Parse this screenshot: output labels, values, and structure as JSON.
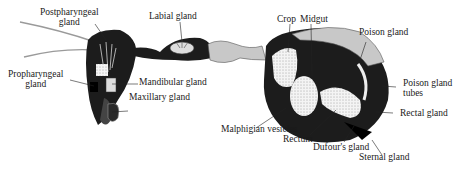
{
  "diagram": {
    "colors": {
      "body_dark": "#1c1c1c",
      "body_light": "#c8c8c8",
      "stipple": "#f2f2f2",
      "line": "#333333"
    },
    "labels": {
      "postpharyngeal_1": "Postpharyngeal",
      "postpharyngeal_2": "gland",
      "labial": "Labial gland",
      "propharyngeal_1": "Propharyngeal",
      "propharyngeal_2": "gland",
      "mandibular": "Mandibular gland",
      "maxillary": "Maxillary gland",
      "crop": "Crop",
      "midgut": "Midgut",
      "poison": "Poison gland",
      "poison_tubes_1": "Poison gland",
      "poison_tubes_2": "tubes",
      "rectal": "Rectal gland",
      "malphigian": "Malphigian vesicles",
      "rectum": "Rectum",
      "dufours": "Dufour's gland",
      "sternal": "Sternal gland"
    }
  }
}
